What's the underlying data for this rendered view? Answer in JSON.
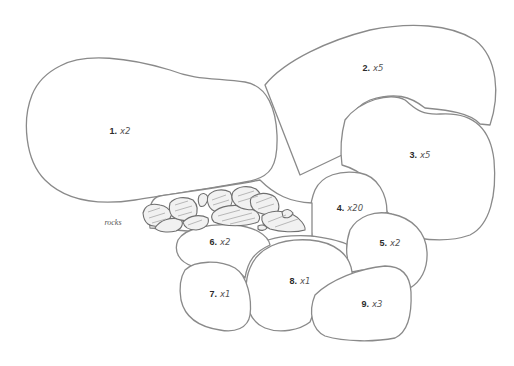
{
  "diagram": {
    "type": "pencil sketch layout of stone pieces",
    "stroke_color": "#8a8a8a",
    "background": "#ffffff",
    "pieces": [
      {
        "number": "1.",
        "quantity": "x2",
        "label_pos": [
          120,
          131
        ]
      },
      {
        "number": "2.",
        "quantity": "x5",
        "label_pos": [
          373,
          68
        ]
      },
      {
        "number": "3.",
        "quantity": "x5",
        "label_pos": [
          420,
          155
        ]
      },
      {
        "number": "4.",
        "quantity": "x20",
        "label_pos": [
          350,
          208
        ]
      },
      {
        "number": "5.",
        "quantity": "x2",
        "label_pos": [
          390,
          243
        ]
      },
      {
        "number": "6.",
        "quantity": "x2",
        "label_pos": [
          220,
          242
        ]
      },
      {
        "number": "7.",
        "quantity": "x1",
        "label_pos": [
          220,
          294
        ]
      },
      {
        "number": "8.",
        "quantity": "x1",
        "label_pos": [
          300,
          281
        ]
      },
      {
        "number": "9.",
        "quantity": "x3",
        "label_pos": [
          372,
          304
        ]
      }
    ],
    "annotations": {
      "rocks": "rocks"
    }
  }
}
